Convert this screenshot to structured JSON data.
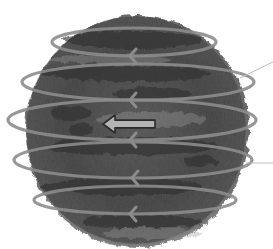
{
  "diagram": {
    "colors": {
      "background": "#ffffff",
      "sphere_dark": "#3a3a3a",
      "sphere_mid": "#6e6e6e",
      "sphere_light": "#9a9a9a",
      "ring": "#8c8c8c",
      "arrow_fill": "#b4b4b4",
      "arrow_stroke": "#2a2a2a",
      "leader_line": "#bdbdbd"
    },
    "sphere": {
      "cx": 136,
      "cy": 130,
      "rx": 112,
      "ry": 116
    },
    "rings": [
      {
        "cy": 42,
        "rx": 84,
        "ry": 14,
        "left": 52,
        "right": 216,
        "arrow_x": 132
      },
      {
        "cy": 82,
        "rx": 118,
        "ry": 18,
        "left": 22,
        "right": 254,
        "arrow_x": 132
      },
      {
        "cy": 120,
        "rx": 124,
        "ry": 20,
        "left": 8,
        "right": 256,
        "arrow_x": 132
      },
      {
        "cy": 160,
        "rx": 116,
        "ry": 18,
        "left": 14,
        "right": 252,
        "arrow_x": 134
      },
      {
        "cy": 200,
        "rx": 98,
        "ry": 14,
        "left": 34,
        "right": 236,
        "arrow_x": 132
      }
    ],
    "center_arrow": {
      "direction": "left",
      "x": 103,
      "y": 124,
      "length": 52,
      "height": 14
    },
    "leader_lines": [
      {
        "x1": 240,
        "y1": 78,
        "x2": 273,
        "y2": 62
      },
      {
        "x1": 246,
        "y1": 163,
        "x2": 273,
        "y2": 163
      }
    ]
  }
}
